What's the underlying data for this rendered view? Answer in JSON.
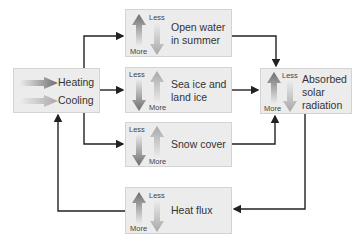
{
  "diagram": {
    "source": {
      "heating": "Heating",
      "cooling": "Cooling"
    },
    "nodes": [
      {
        "id": "open-water",
        "text_line1": "Open water",
        "text_line2": "in summer",
        "top": "Less",
        "bottom": "More",
        "dark_arrow": "up"
      },
      {
        "id": "sea-ice",
        "text_line1": "Sea ice and",
        "text_line2": "land ice",
        "top": "Less",
        "bottom": "More",
        "dark_arrow": "down"
      },
      {
        "id": "snow-cover",
        "text_line1": "Snow cover",
        "top": "Less",
        "bottom": "More",
        "dark_arrow": "down"
      },
      {
        "id": "heat-flux",
        "text_line1": "Heat flux",
        "top": "Less",
        "bottom": "More",
        "dark_arrow": "up"
      }
    ],
    "target": {
      "line1": "Absorbed",
      "line2": "solar",
      "line3": "radiation",
      "top": "Less",
      "bottom": "More"
    }
  },
  "colors": {
    "box_bg": "#ececec",
    "dark_arrow": "#6d6d6d",
    "light_arrow": "#a8a8a8",
    "line": "#222222"
  }
}
